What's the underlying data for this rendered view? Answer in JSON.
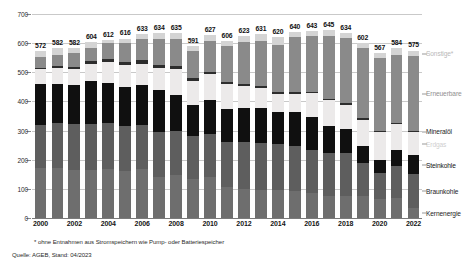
{
  "chart_data": {
    "type": "bar",
    "subtype": "stacked-bar",
    "title": "",
    "xlabel": "",
    "ylabel": "",
    "ylim": [
      0,
      700
    ],
    "yticks": [
      0,
      100,
      200,
      300,
      400,
      500,
      600,
      700
    ],
    "grid": true,
    "legend_position": "right",
    "categories": [
      "2000",
      "2001",
      "2002",
      "2003",
      "2004",
      "2005",
      "2006",
      "2007",
      "2008",
      "2009",
      "2010",
      "2011",
      "2012",
      "2013",
      "2014",
      "2015",
      "2016",
      "2017",
      "2018",
      "2019",
      "2020",
      "2021",
      "2022"
    ],
    "tick_labels": [
      "2000",
      "2002",
      "2004",
      "2006",
      "2008",
      "2010",
      "2012",
      "2014",
      "2016",
      "2018",
      "2020",
      "2022"
    ],
    "totals": [
      572,
      582,
      582,
      604,
      612,
      616,
      633,
      634,
      635,
      591,
      627,
      606,
      623,
      631,
      620,
      640,
      643,
      645,
      634,
      602,
      567,
      584,
      575
    ],
    "series": [
      {
        "name": "Kernenergie",
        "color": "#6e6e6e",
        "values": [
          170,
          171,
          165,
          165,
          167,
          163,
          167,
          141,
          148,
          135,
          141,
          108,
          99,
          97,
          97,
          92,
          85,
          76,
          76,
          75,
          64,
          69,
          35
        ]
      },
      {
        "name": "Braunkohle",
        "color": "#5e5e5e",
        "values": [
          148,
          155,
          158,
          158,
          158,
          154,
          151,
          155,
          151,
          146,
          146,
          153,
          161,
          161,
          156,
          155,
          150,
          148,
          146,
          114,
          92,
          110,
          116
        ]
      },
      {
        "name": "Steinkohle",
        "color": "#101010",
        "values": [
          143,
          134,
          134,
          146,
          140,
          134,
          137,
          142,
          124,
          107,
          117,
          112,
          116,
          121,
          111,
          117,
          112,
          93,
          83,
          57,
          43,
          55,
          64
        ]
      },
      {
        "name": "Erdgas",
        "color": "#eceaea",
        "values": [
          49,
          55,
          56,
          61,
          71,
          73,
          75,
          77,
          89,
          81,
          89,
          86,
          76,
          68,
          61,
          62,
          81,
          87,
          83,
          91,
          96,
          89,
          81
        ]
      },
      {
        "name": "Mineralöl",
        "color": "#2d2d2d",
        "values": [
          6,
          6,
          7,
          9,
          10,
          12,
          11,
          10,
          9,
          10,
          9,
          7,
          8,
          7,
          6,
          6,
          6,
          6,
          5,
          5,
          4,
          4,
          4
        ]
      },
      {
        "name": "Erneuerbare",
        "color": "#8a8a8a",
        "values": [
          38,
          40,
          45,
          46,
          56,
          63,
          72,
          88,
          93,
          95,
          105,
          124,
          143,
          152,
          162,
          189,
          190,
          216,
          225,
          242,
          251,
          234,
          256
        ]
      },
      {
        "name": "Sonstige*",
        "color": "#d4d4d4",
        "values": [
          18,
          21,
          17,
          19,
          10,
          17,
          20,
          21,
          21,
          17,
          20,
          16,
          20,
          25,
          27,
          19,
          19,
          19,
          16,
          18,
          17,
          23,
          19
        ]
      }
    ],
    "annotations": {
      "footnote": "* ohne Entnahmen aus Stromspeichern wie Pump- oder Batteriespeicher",
      "source": "Quelle: AGEB, Stand: 04/2023"
    }
  },
  "legend": {
    "items": [
      {
        "label": "Sonstige*",
        "color": "#d4d4d4",
        "text_color": "#b9b9b9"
      },
      {
        "label": "Erneuerbare",
        "color": "#8a8a8a",
        "text_color": "#8f8f8f"
      },
      {
        "label": "Mineralöl",
        "color": "#2d2d2d",
        "text_color": "#1c1c1c"
      },
      {
        "label": "Erdgas",
        "color": "#eceaea",
        "text_color": "#cfcfcf"
      },
      {
        "label": "Steinkohle",
        "color": "#101010",
        "text_color": "#111111"
      },
      {
        "label": "Braunkohle",
        "color": "#5e5e5e",
        "text_color": "#1c1c1c"
      },
      {
        "label": "Kernenergie",
        "color": "#6e6e6e",
        "text_color": "#1c1c1c"
      }
    ]
  }
}
